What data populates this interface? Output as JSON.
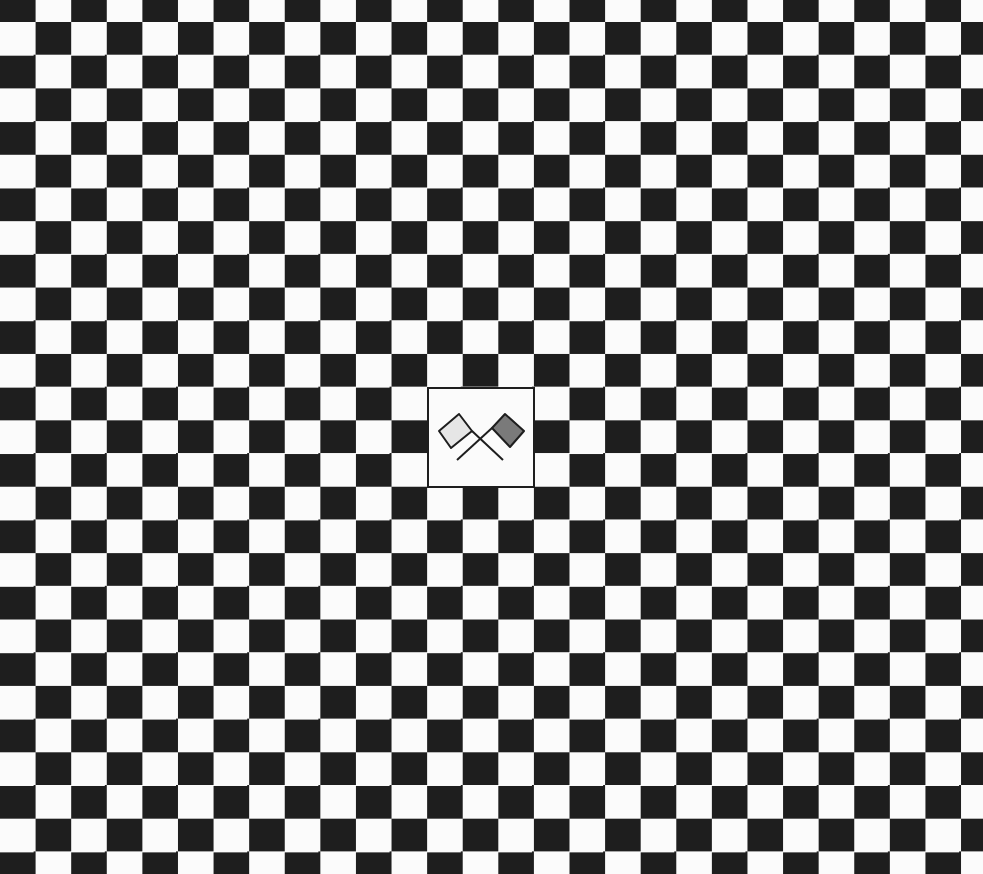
{
  "board": {
    "pattern": "checkerboard",
    "columns": 28,
    "rows": 27,
    "cell_width_px": 35.6,
    "cell_height_px": 33.2,
    "dark_color": "#1e1e1e",
    "light_color": "#fbfbfb"
  },
  "emblem": {
    "icon": "crossed-racing-flags-icon",
    "border_color": "#1e1e1e",
    "background": "#fbfbfb",
    "flags": [
      {
        "side": "left",
        "fill": "#e6e6e6"
      },
      {
        "side": "right",
        "fill": "#7a7a7a"
      }
    ]
  }
}
